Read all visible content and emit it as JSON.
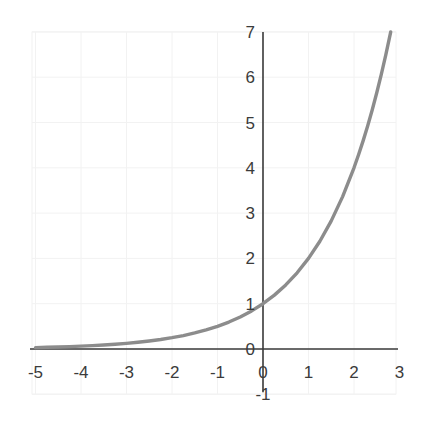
{
  "chart_data": {
    "type": "line",
    "title": "",
    "subtitle": "",
    "xlabel": "",
    "ylabel": "",
    "xlim": [
      -5,
      3
    ],
    "ylim": [
      -1,
      7
    ],
    "grid": true,
    "legend": null,
    "x_ticks": [
      "-5",
      "-4",
      "-3",
      "-2",
      "-1",
      "0",
      "1",
      "2",
      "3"
    ],
    "x_tick_values": [
      -5,
      -4,
      -3,
      -2,
      -1,
      0,
      1,
      2,
      3
    ],
    "y_ticks": [
      "-1",
      "0",
      "1",
      "2",
      "3",
      "4",
      "5",
      "6",
      "7"
    ],
    "y_tick_values": [
      -1,
      0,
      1,
      2,
      3,
      4,
      5,
      6,
      7
    ],
    "series": [
      {
        "name": "exponential-curve",
        "equation": "y = 2^x",
        "color": "#8c8c8c",
        "line_width": 3.4,
        "x": [
          -5.0,
          -4.75,
          -4.5,
          -4.25,
          -4.0,
          -3.75,
          -3.5,
          -3.25,
          -3.0,
          -2.75,
          -2.5,
          -2.25,
          -2.0,
          -1.75,
          -1.5,
          -1.25,
          -1.0,
          -0.75,
          -0.5,
          -0.25,
          0.0,
          0.25,
          0.5,
          0.75,
          1.0,
          1.25,
          1.5,
          1.75,
          2.0,
          2.1,
          2.2,
          2.3,
          2.4,
          2.5,
          2.6,
          2.7,
          2.807
        ],
        "values": [
          0.031,
          0.037,
          0.044,
          0.053,
          0.063,
          0.074,
          0.088,
          0.105,
          0.125,
          0.149,
          0.177,
          0.21,
          0.25,
          0.297,
          0.354,
          0.42,
          0.5,
          0.595,
          0.707,
          0.841,
          1.0,
          1.189,
          1.414,
          1.682,
          2.0,
          2.378,
          2.828,
          3.364,
          4.0,
          4.287,
          4.595,
          4.925,
          5.278,
          5.657,
          6.063,
          6.498,
          7.0
        ]
      }
    ],
    "axis_color": "#3a3a3a",
    "grid_color": "#f2f2f2",
    "background_color": "#ffffff"
  },
  "geometry": {
    "plot_left_px": 32,
    "plot_right_px": 396,
    "plot_top_px": 32,
    "plot_bottom_px": 394,
    "origin_x_px": 263,
    "origin_y_px": 349,
    "unit_x_px": 45.5,
    "unit_y_px": 45.3
  }
}
